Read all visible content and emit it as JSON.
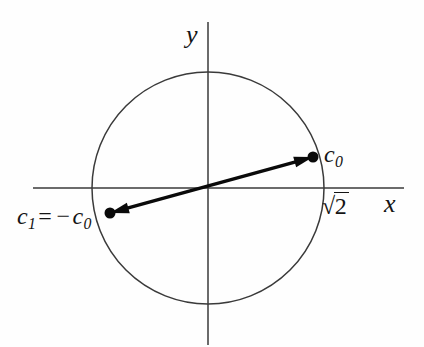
{
  "figure": {
    "background_color": "#fefefe",
    "line_color": "#3a3a3a",
    "arrow_color": "#0a0a0a",
    "text_color": "#141414"
  },
  "axes": {
    "x": {
      "label": "x",
      "label_x": 384,
      "label_y": 191,
      "y_position": 188,
      "start_x": 33,
      "end_x": 404
    },
    "y": {
      "label": "y",
      "label_x": 186,
      "label_y": 22,
      "x_position": 208,
      "start_y": 22,
      "end_y": 345
    },
    "origin": {
      "x": 208,
      "y": 188
    }
  },
  "circle": {
    "center_x": 208,
    "center_y": 188,
    "radius": 116,
    "radius_label": "√2",
    "radius_sign": "√",
    "radius_value": "2",
    "radius_label_x": 322,
    "radius_label_y": 194
  },
  "points": [
    {
      "id": "c0",
      "label": "c",
      "subscript": "0",
      "x": 313,
      "y": 157,
      "label_x": 324,
      "label_y": 142,
      "dot_radius": 5.5
    },
    {
      "id": "c1",
      "label_lhs": "c",
      "subscript_lhs": "1",
      "operator_eq": "=",
      "operator_neg": "−",
      "label_rhs": "c",
      "subscript_rhs": "0",
      "x": 110,
      "y": 213,
      "label_x": 17,
      "label_y": 204,
      "dot_radius": 5.5
    }
  ],
  "arrow": {
    "name": "double-headed-vector",
    "from_x": 110,
    "from_y": 213,
    "to_x": 313,
    "to_y": 157,
    "stroke_width": 3.4,
    "head_length": 19,
    "head_width": 11,
    "double_headed": true
  }
}
